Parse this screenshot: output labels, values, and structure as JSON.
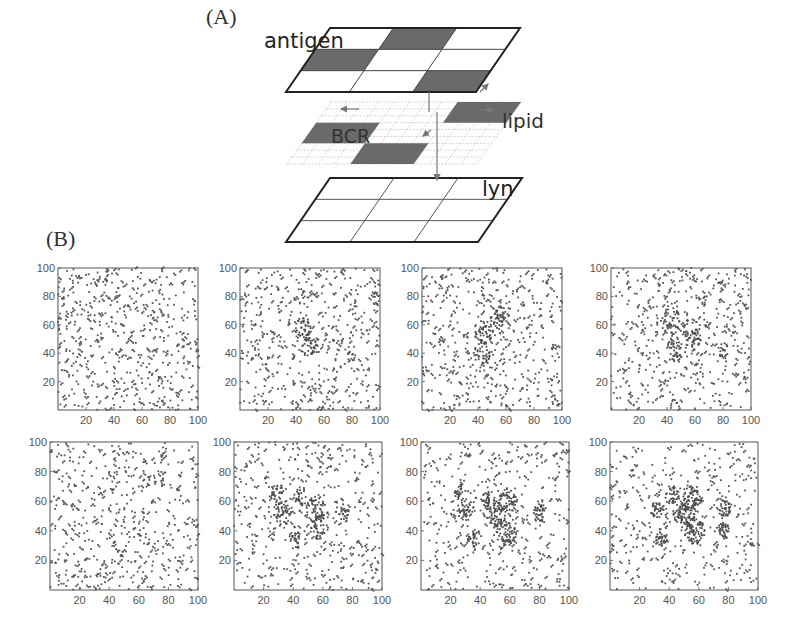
{
  "figure": {
    "panel_a_label": "(A)",
    "panel_b_label": "(B)",
    "diagram": {
      "layers": [
        {
          "name": "antigen",
          "label": "antigen"
        },
        {
          "name": "lipid",
          "label": "lipid",
          "sublabel": "BCR"
        },
        {
          "name": "lyn",
          "label": "lyn"
        }
      ],
      "antigen_grid": {
        "rows": 3,
        "cols": 3,
        "filled": [
          [
            0,
            1
          ],
          [
            1,
            0
          ],
          [
            2,
            2
          ]
        ]
      },
      "lipid_filled": [
        [
          0,
          2
        ],
        [
          1,
          0
        ],
        [
          2,
          1
        ]
      ],
      "colors": {
        "filled": "#6a6a6a",
        "outline": "#222222",
        "lipid_grid": "#bbbbbb"
      }
    }
  },
  "chart_data": [
    {
      "type": "scatter",
      "panel": "B-row1-col1",
      "xlim": [
        0,
        100
      ],
      "ylim": [
        0,
        100
      ],
      "xticks": [
        20,
        40,
        60,
        80,
        100
      ],
      "yticks": [
        20,
        40,
        60,
        80,
        100
      ],
      "clustering": 0.0,
      "clusters": []
    },
    {
      "type": "scatter",
      "panel": "B-row1-col2",
      "xlim": [
        0,
        100
      ],
      "ylim": [
        0,
        100
      ],
      "xticks": [
        20,
        40,
        60,
        80,
        100
      ],
      "yticks": [
        20,
        40,
        60,
        80,
        100
      ],
      "clustering": 0.08,
      "clusters": [
        [
          45,
          57
        ],
        [
          50,
          45
        ]
      ]
    },
    {
      "type": "scatter",
      "panel": "B-row1-col3",
      "xlim": [
        0,
        100
      ],
      "ylim": [
        0,
        100
      ],
      "xticks": [
        20,
        40,
        60,
        80,
        100
      ],
      "yticks": [
        20,
        40,
        60,
        80,
        100
      ],
      "clustering": 0.12,
      "clusters": [
        [
          44,
          55
        ],
        [
          43,
          40
        ],
        [
          55,
          65
        ]
      ]
    },
    {
      "type": "scatter",
      "panel": "B-row1-col4",
      "xlim": [
        0,
        100
      ],
      "ylim": [
        0,
        100
      ],
      "xticks": [
        20,
        40,
        60,
        80,
        100
      ],
      "yticks": [
        20,
        40,
        60,
        80,
        100
      ],
      "clustering": 0.2,
      "clusters": [
        [
          43,
          62
        ],
        [
          57,
          56
        ],
        [
          46,
          43
        ],
        [
          60,
          48
        ],
        [
          80,
          42
        ]
      ]
    },
    {
      "type": "scatter",
      "panel": "B-row2-col1",
      "xlim": [
        0,
        100
      ],
      "ylim": [
        0,
        100
      ],
      "xticks": [
        20,
        40,
        60,
        80,
        100
      ],
      "yticks": [
        20,
        40,
        60,
        80,
        100
      ],
      "clustering": 0.0,
      "clusters": []
    },
    {
      "type": "scatter",
      "panel": "B-row2-col2",
      "xlim": [
        0,
        100
      ],
      "ylim": [
        0,
        100
      ],
      "xticks": [
        20,
        40,
        60,
        80,
        100
      ],
      "yticks": [
        20,
        40,
        60,
        80,
        100
      ],
      "clustering": 0.35,
      "clusters": [
        [
          55,
          55
        ],
        [
          57,
          42
        ],
        [
          33,
          52
        ],
        [
          42,
          33
        ],
        [
          73,
          52
        ],
        [
          45,
          63
        ],
        [
          30,
          66
        ]
      ]
    },
    {
      "type": "scatter",
      "panel": "B-row2-col3",
      "xlim": [
        0,
        100
      ],
      "ylim": [
        0,
        100
      ],
      "xticks": [
        20,
        40,
        60,
        80,
        100
      ],
      "yticks": [
        20,
        40,
        60,
        80,
        100
      ],
      "clustering": 0.5,
      "clusters": [
        [
          58,
          60
        ],
        [
          50,
          50
        ],
        [
          58,
          38
        ],
        [
          30,
          52
        ],
        [
          36,
          35
        ],
        [
          45,
          62
        ],
        [
          80,
          52
        ],
        [
          27,
          65
        ]
      ]
    },
    {
      "type": "scatter",
      "panel": "B-row2-col4",
      "xlim": [
        0,
        100
      ],
      "ylim": [
        0,
        100
      ],
      "xticks": [
        20,
        40,
        60,
        80,
        100
      ],
      "yticks": [
        20,
        40,
        60,
        80,
        100
      ],
      "clustering": 0.6,
      "clusters": [
        [
          55,
          62
        ],
        [
          50,
          50
        ],
        [
          57,
          40
        ],
        [
          32,
          55
        ],
        [
          35,
          35
        ],
        [
          42,
          64
        ],
        [
          78,
          55
        ],
        [
          77,
          40
        ]
      ]
    }
  ]
}
